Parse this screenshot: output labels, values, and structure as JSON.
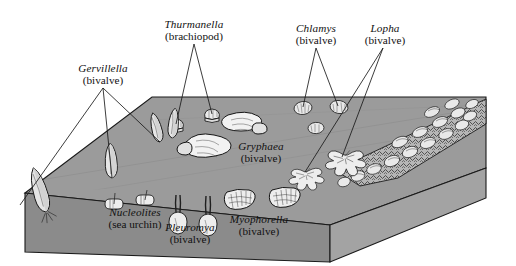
{
  "figure": {
    "type": "block-diagram",
    "background_color": "#ffffff",
    "top_surface_color": "#9a9a9a",
    "front_face_color": "#8c8c8c",
    "side_face_color": "#a2a2a2",
    "outline_color": "#1a1a1a",
    "leader_line_color": "#1a1a1a",
    "shell_fill": "#efefef"
  },
  "labels": [
    {
      "id": "gervillella",
      "genus": "Gervillella",
      "group": "(bivalve)",
      "x": 72,
      "y": 62,
      "w": 62,
      "leaders": [
        [
          103,
          88,
          20,
          205
        ],
        [
          103,
          88,
          112,
          178
        ],
        [
          103,
          88,
          160,
          142
        ]
      ]
    },
    {
      "id": "thurmanella",
      "genus": "Thurmanella",
      "group": "(brachiopod)",
      "x": 155,
      "y": 18,
      "w": 78,
      "leaders": [
        [
          194,
          44,
          176,
          124
        ],
        [
          194,
          44,
          212,
          114
        ]
      ]
    },
    {
      "id": "chlamys",
      "genus": "Chlamys",
      "group": "(bivalve)",
      "x": 289,
      "y": 22,
      "w": 54,
      "leaders": [
        [
          316,
          48,
          303,
          107
        ],
        [
          316,
          48,
          338,
          106
        ]
      ]
    },
    {
      "id": "lopha",
      "genus": "Lopha",
      "group": "(bivalve)",
      "x": 361,
      "y": 22,
      "w": 48,
      "leaders": [
        [
          383,
          48,
          305,
          172
        ],
        [
          383,
          48,
          342,
          157
        ]
      ]
    },
    {
      "id": "gryphaea",
      "genus": "Gryphaea",
      "group": "(bivalve)",
      "x": 232,
      "y": 140,
      "w": 58,
      "leaders": []
    },
    {
      "id": "nucleolites",
      "genus": "Nucleolites",
      "group": "(sea urchin)",
      "x": 99,
      "y": 206,
      "w": 72,
      "leaders": []
    },
    {
      "id": "pleuromya",
      "genus": "Pleuromya",
      "group": "(bivalve)",
      "x": 160,
      "y": 221,
      "w": 60,
      "leaders": []
    },
    {
      "id": "myophorella",
      "genus": "Myophorella",
      "group": "(bivalve)",
      "x": 224,
      "y": 213,
      "w": 70,
      "leaders": []
    }
  ],
  "fauna_on_surface": {
    "gervillella_count": 3,
    "thurmanella_count": 2,
    "chlamys_count": 3,
    "gryphaea_count": 2,
    "lopha_clusters": 2
  },
  "fauna_in_section": {
    "gervillella_count": 1,
    "nucleolites_count": 2,
    "pleuromya_count": 2,
    "myophorella_count": 2
  },
  "shell_bed": {
    "name": "oyster shell bank",
    "position": "right margin of block"
  }
}
